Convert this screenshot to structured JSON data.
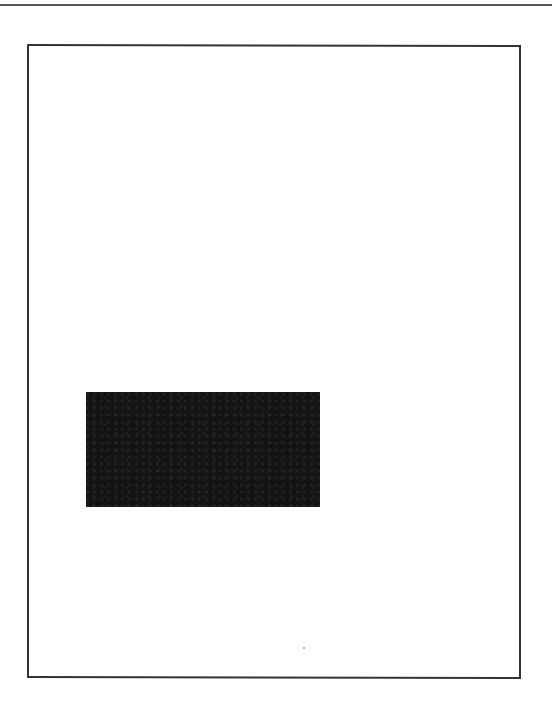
{
  "page": {
    "type": "scanned-page",
    "background_color": "#ffffff",
    "top_rule": {
      "color": "#555555"
    },
    "frame": {
      "border_color": "#333333"
    },
    "redaction_block": {
      "color": "#141414",
      "text": ""
    }
  }
}
